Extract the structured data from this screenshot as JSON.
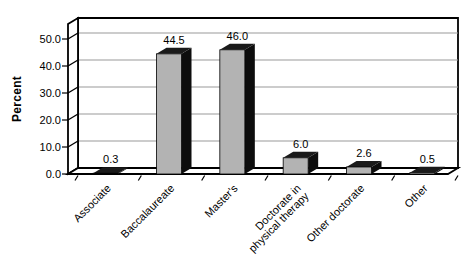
{
  "chart_data": {
    "type": "bar",
    "style": "3d-bar",
    "title": "",
    "xlabel": "",
    "ylabel": "Percent",
    "categories": [
      "Associate",
      "Baccalaureate",
      "Master's",
      "Doctorate in\nphysical therapy",
      "Other doctorate",
      "Other"
    ],
    "values": [
      0.3,
      44.5,
      46.0,
      6.0,
      2.6,
      0.5
    ],
    "value_labels": [
      "0.3",
      "44.5",
      "46.0",
      "6.0",
      "2.6",
      "0.5"
    ],
    "ytick_values": [
      0,
      10,
      20,
      30,
      40,
      50
    ],
    "ytick_labels": [
      "0.0",
      "10.0",
      "20.0",
      "30.0",
      "40.0",
      "50.0"
    ],
    "ylim": [
      0,
      55.5
    ],
    "grid": true,
    "legend": "none",
    "colors": {
      "bar_front": "#b3b3b3",
      "bar_side": "#0d0d0d",
      "bar_top": "#1a1a1a",
      "gridline": "#999999",
      "frame": "#000000",
      "wall": "#ffffff",
      "background": "#ffffff",
      "text": "#000000"
    }
  }
}
